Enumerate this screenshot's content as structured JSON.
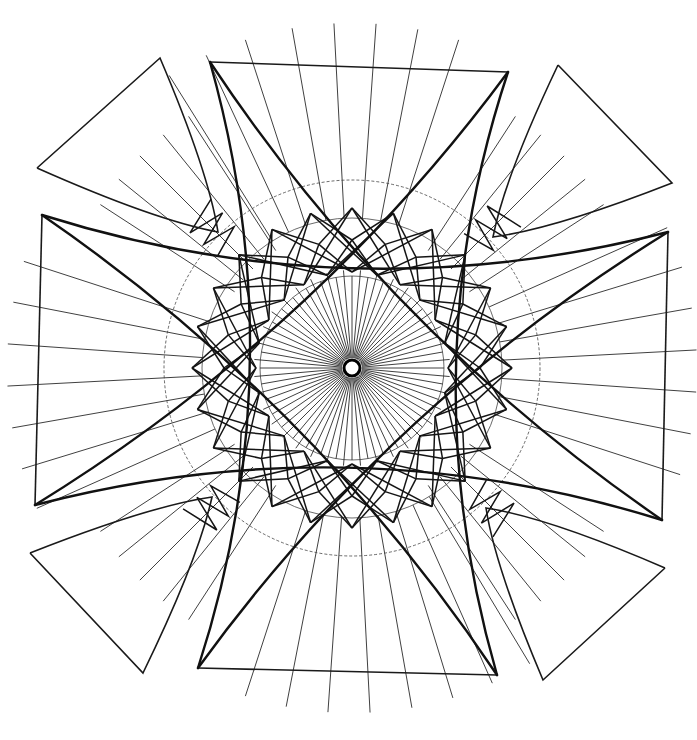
{
  "diagram": {
    "title": "",
    "colors": {
      "ink": "#111111",
      "background": "#ffffff"
    },
    "center": {
      "x": 352,
      "y": 368
    },
    "hub_radius": 8,
    "ray_count": 72,
    "ray_inner_radius": 10,
    "ray_inner_extent": 92,
    "guide_circles": [
      92,
      150,
      188
    ],
    "frame_edges": {
      "top": {
        "x1": 210,
        "y1": 62,
        "x2": 508,
        "y2": 72
      },
      "bottom": {
        "x1": 198,
        "y1": 668,
        "x2": 497,
        "y2": 675
      },
      "left": {
        "x1": 42,
        "y1": 215,
        "x2": 35,
        "y2": 505
      },
      "right": {
        "x1": 668,
        "y1": 232,
        "x2": 662,
        "y2": 520
      }
    },
    "petals": [
      {
        "name": "top-left",
        "points": [
          [
            37,
            168
          ],
          [
            160,
            58
          ],
          [
            218,
            232
          ]
        ]
      },
      {
        "name": "top-right",
        "points": [
          [
            558,
            65
          ],
          [
            672,
            183
          ],
          [
            493,
            237
          ]
        ]
      },
      {
        "name": "bottom-left",
        "points": [
          [
            30,
            553
          ],
          [
            143,
            673
          ],
          [
            212,
            497
          ]
        ]
      },
      {
        "name": "bottom-right",
        "points": [
          [
            665,
            568
          ],
          [
            543,
            680
          ],
          [
            486,
            508
          ]
        ]
      }
    ],
    "outer_ray_angles_deg": [
      -100,
      -93,
      -86,
      -79,
      -72,
      -108,
      -115,
      -122,
      80,
      87,
      94,
      101,
      108,
      73,
      66,
      59,
      -10,
      -3,
      4,
      11,
      18,
      -17,
      -24,
      170,
      177,
      184,
      191,
      198,
      163,
      156
    ]
  }
}
